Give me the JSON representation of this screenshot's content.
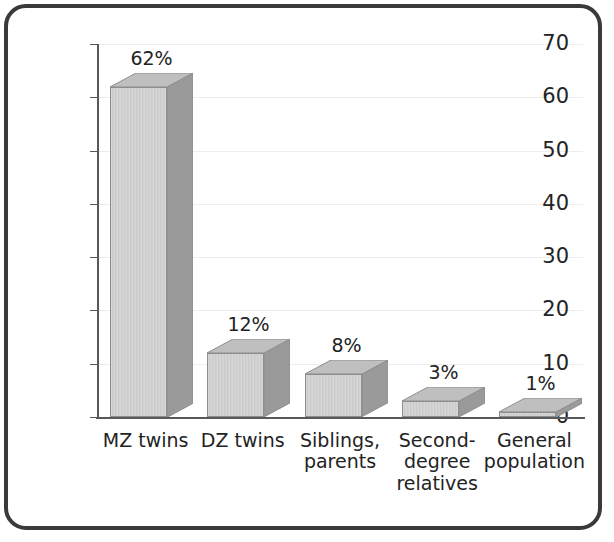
{
  "figure": {
    "frame_color": "#3a3a3c",
    "background": "#ffffff"
  },
  "chart_data": {
    "type": "bar",
    "title": "",
    "subtitle": "",
    "xlabel": "",
    "ylabel": "Per cent with bipolar depression",
    "categories": [
      "MZ twins",
      "DZ twins",
      "Siblings,\nparents",
      "Second-\ndegree\nrelatives",
      "General\npopulation"
    ],
    "values": [
      62,
      12,
      8,
      3,
      1
    ],
    "value_labels": [
      "62%",
      "12%",
      "8%",
      "3%",
      "1%"
    ],
    "ylim": [
      0,
      70
    ],
    "yticks": [
      0,
      10,
      20,
      30,
      40,
      50,
      60,
      70
    ],
    "ytick_labels": [
      "0",
      "10",
      "20",
      "30",
      "40",
      "50",
      "60",
      "70"
    ],
    "grid": true,
    "grid_axis": "y",
    "grid_color": "#ededed",
    "legend": "none",
    "bar_style": "3d",
    "bar_front_color": "#d2d2d2",
    "bar_side_color": "#9a9a9a",
    "bar_top_color": "#bfbfbf",
    "bar_edge_color": "#8d8d8d",
    "axis_color": "#585858",
    "text_color": "#232323"
  }
}
